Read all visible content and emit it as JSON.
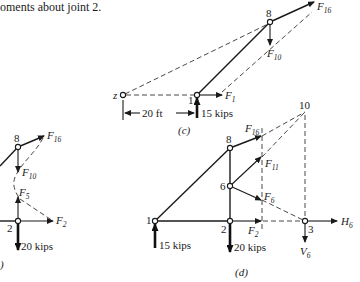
{
  "text": {
    "top_line": "oments about joint 2."
  },
  "part_c": {
    "caption": "(c)",
    "point_z": "z",
    "node_1": "1",
    "node_8": "8",
    "force_F1": "F",
    "force_F1_sub": "1",
    "force_F10": "F",
    "force_F10_sub": "10",
    "force_F16": "F",
    "force_F16_sub": "16",
    "load": "15 kips",
    "dimension": "20 ft"
  },
  "part_b": {
    "caption": ")",
    "node_8": "8",
    "node_2": "2",
    "force_F16": "F",
    "force_F16_sub": "16",
    "force_F10": "F",
    "force_F10_sub": "10",
    "force_F5": "F",
    "force_F5_sub": "5",
    "force_F2": "F",
    "force_F2_sub": "2",
    "load": "20 kips"
  },
  "part_d": {
    "caption": "(d)",
    "node_1": "1",
    "node_2": "2",
    "node_3": "3",
    "node_6": "6",
    "node_8": "8",
    "node_10": "10",
    "force_F16": "F",
    "force_F16_sub": "16",
    "force_F11": "F",
    "force_F11_sub": "11",
    "force_F6": "F",
    "force_F6_sub": "6",
    "force_F2": "F",
    "force_F2_sub": "2",
    "force_H6": "H",
    "force_H6_sub": "6",
    "force_V6": "V",
    "force_V6_sub": "6",
    "load_left": "15 kips",
    "load_mid": "20 kips"
  }
}
